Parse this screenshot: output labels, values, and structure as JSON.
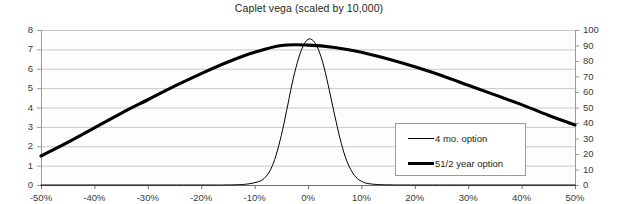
{
  "chart_data": {
    "type": "line",
    "title": "Caplet vega (scaled by 10,000)",
    "xlabel": "",
    "ylabel": "",
    "grid": true,
    "legend_position": "inside-right",
    "x_tick_labels": [
      "-50%",
      "-40%",
      "-30%",
      "-20%",
      "-10%",
      "0%",
      "10%",
      "20%",
      "30%",
      "40%",
      "50%"
    ],
    "x": [
      -50,
      -40,
      -30,
      -20,
      -10,
      0,
      10,
      20,
      30,
      40,
      50
    ],
    "xlim": [
      -50,
      50
    ],
    "y_left_tick_labels": [
      "0",
      "1",
      "2",
      "3",
      "4",
      "5",
      "6",
      "7",
      "8"
    ],
    "y_left_ticks": [
      0,
      1,
      2,
      3,
      4,
      5,
      6,
      7,
      8
    ],
    "ylim_left": [
      0,
      8
    ],
    "y_right_tick_labels": [
      "0",
      "10",
      "20",
      "30",
      "40",
      "50",
      "60",
      "70",
      "80",
      "90",
      "100"
    ],
    "y_right_ticks": [
      0,
      10,
      20,
      30,
      40,
      50,
      60,
      70,
      80,
      90,
      100
    ],
    "ylim_right": [
      0,
      100
    ],
    "series": [
      {
        "name": "4 mo. option",
        "axis": "right",
        "line_width": "thin",
        "color": "#000000",
        "x": [
          -50,
          -40,
          -30,
          -20,
          -16,
          -13,
          -11,
          -9,
          -8,
          -7,
          -6,
          -5,
          -4,
          -3,
          -2,
          -1,
          0,
          1,
          2,
          3,
          4,
          5,
          6,
          7,
          8,
          9,
          10,
          11,
          13,
          16,
          20,
          30,
          40,
          50
        ],
        "values": [
          0,
          0,
          0,
          0,
          0,
          0.2,
          0.8,
          2.5,
          5,
          10,
          19,
          32,
          48,
          65,
          79,
          89,
          94,
          93,
          87,
          76,
          61,
          45,
          30,
          18,
          10,
          5,
          2.4,
          1.1,
          0.3,
          0.05,
          0,
          0,
          0,
          0
        ]
      },
      {
        "name": "51/2 year option",
        "axis": "left",
        "line_width": "thick",
        "color": "#000000",
        "x": [
          -50,
          -45,
          -40,
          -35,
          -30,
          -25,
          -20,
          -15,
          -10,
          -5,
          0,
          5,
          10,
          15,
          20,
          25,
          30,
          35,
          40,
          45,
          50
        ],
        "values": [
          1.5,
          2.2,
          2.95,
          3.7,
          4.4,
          5.1,
          5.75,
          6.35,
          6.85,
          7.2,
          7.22,
          7.1,
          6.85,
          6.5,
          6.1,
          5.65,
          5.15,
          4.65,
          4.15,
          3.6,
          3.1
        ]
      }
    ]
  },
  "legend": {
    "items": [
      {
        "label": "4 mo. option"
      },
      {
        "label": "51/2 year option"
      }
    ]
  }
}
